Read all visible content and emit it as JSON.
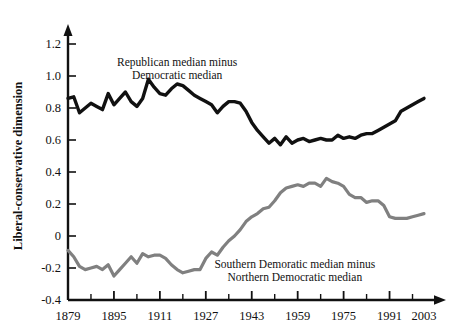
{
  "chart_data": {
    "type": "line",
    "title": "",
    "xlabel": "",
    "ylabel": "Liberal-conservative dimension",
    "xlim": [
      1879,
      2003
    ],
    "ylim": [
      -0.4,
      1.2
    ],
    "grid": false,
    "legend_position": "inline-annotations",
    "xticks": [
      "1879",
      "1895",
      "1911",
      "1927",
      "1943",
      "1959",
      "1975",
      "1991",
      "2003"
    ],
    "xtick_values": [
      1879,
      1895,
      1911,
      1927,
      1943,
      1959,
      1975,
      1991,
      2003
    ],
    "xminor_interval": 8,
    "yticks": [
      "-0.4",
      "-0.2",
      "0",
      "0.2",
      "0.4",
      "0.6",
      "0.8",
      "1.0",
      "1.2"
    ],
    "ytick_values": [
      -0.4,
      -0.2,
      0,
      0.2,
      0.4,
      0.6,
      0.8,
      1.0,
      1.2
    ],
    "annotations": [
      {
        "name": "republican-minus-democratic-label",
        "line1": "Republican median minus",
        "line2": "Democratic median",
        "x": 1917,
        "y": 1.06
      },
      {
        "name": "southern-minus-northern-label",
        "line1": "Southern Demoratic median minus",
        "line2": "Northern Democratic median",
        "x": 1958,
        "y": -0.2
      }
    ],
    "series": [
      {
        "name": "Republican median minus Democratic median",
        "color": "#111111",
        "width": 3.4,
        "x": [
          1879,
          1881,
          1883,
          1885,
          1887,
          1889,
          1891,
          1893,
          1895,
          1897,
          1899,
          1901,
          1903,
          1905,
          1907,
          1909,
          1911,
          1913,
          1915,
          1917,
          1919,
          1921,
          1923,
          1925,
          1927,
          1929,
          1931,
          1933,
          1935,
          1937,
          1939,
          1941,
          1943,
          1945,
          1947,
          1949,
          1951,
          1953,
          1955,
          1957,
          1959,
          1961,
          1963,
          1965,
          1967,
          1969,
          1971,
          1973,
          1975,
          1977,
          1979,
          1981,
          1983,
          1985,
          1987,
          1989,
          1991,
          1993,
          1995,
          1997,
          1999,
          2001,
          2003
        ],
        "values": [
          0.86,
          0.87,
          0.77,
          0.8,
          0.83,
          0.81,
          0.79,
          0.89,
          0.82,
          0.86,
          0.9,
          0.84,
          0.81,
          0.86,
          0.98,
          0.93,
          0.89,
          0.88,
          0.92,
          0.95,
          0.94,
          0.91,
          0.88,
          0.86,
          0.84,
          0.82,
          0.77,
          0.81,
          0.84,
          0.84,
          0.83,
          0.78,
          0.71,
          0.66,
          0.62,
          0.58,
          0.61,
          0.57,
          0.62,
          0.58,
          0.6,
          0.61,
          0.59,
          0.6,
          0.61,
          0.6,
          0.6,
          0.63,
          0.61,
          0.62,
          0.61,
          0.63,
          0.64,
          0.64,
          0.66,
          0.68,
          0.7,
          0.72,
          0.78,
          0.8,
          0.82,
          0.84,
          0.86
        ]
      },
      {
        "name": "Southern Demoratic median minus Northern Democratic median",
        "color": "#808080",
        "width": 3.2,
        "x": [
          1879,
          1881,
          1883,
          1885,
          1887,
          1889,
          1891,
          1893,
          1895,
          1897,
          1899,
          1901,
          1903,
          1905,
          1907,
          1909,
          1911,
          1913,
          1915,
          1917,
          1919,
          1921,
          1923,
          1925,
          1927,
          1929,
          1931,
          1933,
          1935,
          1937,
          1939,
          1941,
          1943,
          1945,
          1947,
          1949,
          1951,
          1953,
          1955,
          1957,
          1959,
          1961,
          1963,
          1965,
          1967,
          1969,
          1971,
          1973,
          1975,
          1977,
          1979,
          1981,
          1983,
          1985,
          1987,
          1989,
          1991,
          1993,
          1995,
          1997,
          1999,
          2001,
          2003
        ],
        "values": [
          -0.09,
          -0.13,
          -0.19,
          -0.21,
          -0.2,
          -0.19,
          -0.21,
          -0.18,
          -0.25,
          -0.21,
          -0.17,
          -0.13,
          -0.17,
          -0.11,
          -0.13,
          -0.12,
          -0.12,
          -0.14,
          -0.18,
          -0.21,
          -0.23,
          -0.22,
          -0.21,
          -0.21,
          -0.14,
          -0.1,
          -0.12,
          -0.07,
          -0.03,
          0.0,
          0.04,
          0.09,
          0.12,
          0.14,
          0.17,
          0.18,
          0.22,
          0.27,
          0.3,
          0.31,
          0.32,
          0.31,
          0.33,
          0.33,
          0.31,
          0.36,
          0.34,
          0.33,
          0.31,
          0.26,
          0.24,
          0.24,
          0.21,
          0.22,
          0.22,
          0.19,
          0.12,
          0.11,
          0.11,
          0.11,
          0.12,
          0.13,
          0.14
        ]
      }
    ]
  }
}
